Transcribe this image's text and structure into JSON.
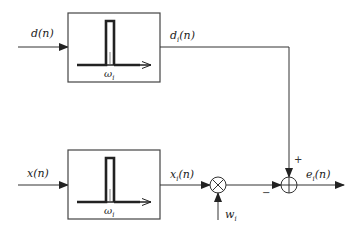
{
  "diagram": {
    "type": "block-diagram",
    "blocks": [
      {
        "id": "filter-top",
        "kind": "bandpass-filter",
        "input": "d(n)",
        "output": "d_i(n)",
        "center_freq_label": "ω_i"
      },
      {
        "id": "filter-bottom",
        "kind": "bandpass-filter",
        "input": "x(n)",
        "output": "x_i(n)",
        "center_freq_label": "ω_i"
      }
    ],
    "operators": [
      {
        "id": "multiplier",
        "symbol": "⊗",
        "inputs": [
          "x_i(n)",
          "w_i"
        ]
      },
      {
        "id": "adder",
        "symbol": "⊕",
        "inputs": [
          "d_i(n) (+)",
          "w_i·x_i(n) (−)"
        ],
        "output": "e_i(n)"
      }
    ]
  },
  "labels": {
    "d_in": {
      "base": "d",
      "sub": "",
      "arg": "(n)"
    },
    "x_in": {
      "base": "x",
      "sub": "",
      "arg": "(n)"
    },
    "d_i": {
      "base": "d",
      "sub": "i",
      "arg": "(n)"
    },
    "x_i": {
      "base": "x",
      "sub": "i",
      "arg": "(n)"
    },
    "e_i": {
      "base": "e",
      "sub": "i",
      "arg": "(n)"
    },
    "w_i": {
      "base": "w",
      "sub": "i",
      "arg": ""
    },
    "omega_top": {
      "base": "ω",
      "sub": "i",
      "arg": ""
    },
    "omega_bottom": {
      "base": "ω",
      "sub": "i",
      "arg": ""
    },
    "plus_sign": "+",
    "minus_sign": "−"
  },
  "colors": {
    "stroke": "#333333",
    "text": "#222222",
    "background": "#ffffff"
  }
}
